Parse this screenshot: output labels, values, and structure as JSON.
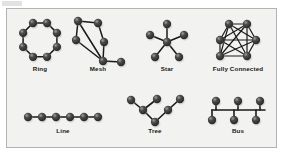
{
  "figure": {
    "background_color": "#f2f2f0",
    "border_color": "#b3b3b3",
    "node_color": "#3a3a3a",
    "node_highlight_color": "#8e8e8e",
    "edge_color": "#1a1a1a",
    "label_color": "#171717"
  },
  "topologies": [
    {
      "id": "ring",
      "label": "Ring",
      "node_count": 8,
      "edge_count": 8,
      "description": "Eight nodes arranged in a closed octagonal loop"
    },
    {
      "id": "mesh",
      "label": "Mesh",
      "node_count": 6,
      "edge_count": 7,
      "description": "Partially meshed cluster with multiple cross links and one pendant node"
    },
    {
      "id": "star",
      "label": "Star",
      "node_count": 6,
      "edge_count": 5,
      "description": "Central hub node with five spokes"
    },
    {
      "id": "fully-connected",
      "label": "Fully Connected",
      "node_count": 6,
      "edge_count": 15,
      "description": "Six nodes in a hexagon with every pair connected"
    },
    {
      "id": "line",
      "label": "Line",
      "node_count": 6,
      "edge_count": 5,
      "description": "Six nodes connected in a single horizontal chain"
    },
    {
      "id": "tree",
      "label": "Tree",
      "node_count": 6,
      "edge_count": 5,
      "description": "Root node at bottom branching upward into two subtrees"
    },
    {
      "id": "bus",
      "label": "Bus",
      "node_count": 6,
      "edge_count": 7,
      "description": "Horizontal backbone with three nodes above and three below"
    }
  ],
  "labels": {
    "ring": "Ring",
    "mesh": "Mesh",
    "star": "Star",
    "fully_connected": "Fully Connected",
    "line": "Line",
    "tree": "Tree",
    "bus": "Bus"
  }
}
